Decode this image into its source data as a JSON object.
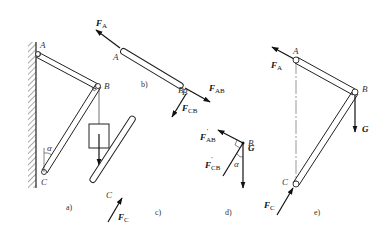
{
  "figure": {
    "panels": [
      {
        "id": "a",
        "caption": "a)",
        "description": "Bracket ABC: bar AB and bar BC pinned to wall at A and C, weight G hanging at B",
        "points": {
          "A": "A",
          "B": "B",
          "C": "C"
        },
        "angle": "α",
        "load": "G"
      },
      {
        "id": "b",
        "caption": "b)",
        "description": "Free-body diagram of bar AB (two-force member)",
        "points": {
          "A": "A",
          "B": "B"
        },
        "forces": {
          "FA": {
            "main": "F",
            "sub": "A"
          },
          "FAB": {
            "main": "F",
            "sub": "AB"
          }
        }
      },
      {
        "id": "c",
        "caption": "c)",
        "description": "Free-body diagram of bar CB (two-force member)",
        "points": {
          "B": "B",
          "C": "C"
        },
        "forces": {
          "FCB": {
            "main": "F",
            "sub": "CB"
          },
          "FC": {
            "main": "F",
            "sub": "C"
          }
        }
      },
      {
        "id": "d",
        "caption": "d)",
        "description": "Free-body diagram of pin B",
        "points": {
          "B": "B"
        },
        "angle": "α",
        "forces": {
          "FAB_prime": {
            "main": "F",
            "sub": "AB",
            "prime": "′"
          },
          "FCB_prime": {
            "main": "F",
            "sub": "CB",
            "prime": "′"
          },
          "G": "G"
        }
      },
      {
        "id": "e",
        "caption": "e)",
        "description": "Free-body diagram of whole structure",
        "points": {
          "A": "A",
          "B": "B",
          "C": "C"
        },
        "forces": {
          "FA": {
            "main": "F",
            "sub": "A"
          },
          "FC": {
            "main": "F",
            "sub": "C"
          },
          "G": "G"
        }
      }
    ]
  }
}
